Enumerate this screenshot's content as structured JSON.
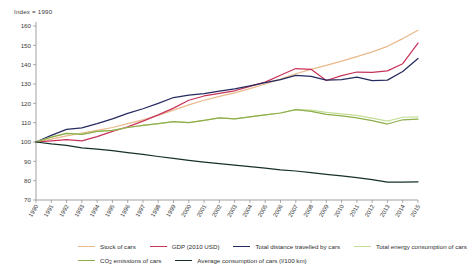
{
  "index_note": "Index = 1990",
  "legend": {
    "items": [
      {
        "label": "Stock of cars",
        "color": "#e8b98a",
        "width": 1.3
      },
      {
        "label": "GDP (2010 USD)",
        "color": "#c9335a",
        "width": 1.6
      },
      {
        "label": "Total distance travelled by cars",
        "color": "#262a5e",
        "width": 1.9
      },
      {
        "label": "Total energy consumption of cars",
        "color": "#c3de96",
        "width": 1.3
      },
      {
        "label": "CO2 emissions of cars",
        "color": "#8fae4b",
        "width": 1.3
      },
      {
        "label": "Average consumption of cars (l/100 km)",
        "color": "#16302a",
        "width": 1.9
      }
    ],
    "co2_prefix": "CO",
    "co2_sub": "2",
    "co2_suffix": " emissions of cars"
  },
  "chart_data": {
    "type": "line",
    "title": "",
    "subtitle": "",
    "xlabel": "",
    "ylabel": "",
    "ylim": [
      70,
      160
    ],
    "yticks": [
      70,
      80,
      90,
      100,
      110,
      120,
      130,
      140,
      150,
      160
    ],
    "grid": false,
    "legend_position": "bottom",
    "x": [
      1990,
      1991,
      1992,
      1993,
      1994,
      1995,
      1996,
      1997,
      1998,
      1999,
      2000,
      2001,
      2002,
      2003,
      2004,
      2005,
      2006,
      2007,
      2008,
      2009,
      2010,
      2011,
      2012,
      2013,
      2014,
      2015
    ],
    "categories": [
      "1990",
      "1991",
      "1992",
      "1993",
      "1994",
      "1995",
      "1996",
      "1997",
      "1998",
      "1999",
      "2000",
      "2001",
      "2002",
      "2003",
      "2004",
      "2005",
      "2006",
      "2007",
      "2008",
      "2009",
      "2010",
      "2011",
      "2012",
      "2013",
      "2014",
      "2015"
    ],
    "series": [
      {
        "name": "Stock of cars",
        "color": "#e8b98a",
        "values": [
          100,
          101.5,
          103.2,
          104.6,
          106.0,
          107.5,
          109.5,
          111.5,
          113.8,
          116.5,
          119.2,
          121.6,
          123.6,
          125.4,
          127.6,
          130.0,
          132.5,
          135.3,
          137.6,
          139.6,
          141.8,
          144.2,
          146.6,
          149.5,
          153.5,
          157.8
        ]
      },
      {
        "name": "GDP (2010 USD)",
        "color": "#c9335a",
        "values": [
          100,
          100.6,
          101.2,
          100.6,
          102.8,
          105.5,
          107.8,
          110.8,
          114.0,
          117.5,
          121.6,
          123.8,
          125.2,
          126.5,
          128.8,
          131.0,
          134.5,
          138.0,
          137.6,
          131.8,
          134.3,
          136.2,
          136.0,
          136.8,
          140.5,
          151.2
        ]
      },
      {
        "name": "Total distance travelled by cars",
        "color": "#262a5e",
        "values": [
          100,
          103.4,
          106.5,
          107.3,
          109.5,
          112.0,
          114.8,
          117.2,
          120.0,
          123.0,
          124.2,
          125.0,
          126.3,
          127.5,
          129.0,
          130.7,
          132.3,
          134.5,
          134.0,
          132.0,
          132.3,
          133.6,
          131.8,
          132.0,
          136.5,
          143.2
        ]
      },
      {
        "name": "Total energy consumption of cars",
        "color": "#c3de96",
        "values": [
          100,
          102.5,
          104.5,
          104.0,
          105.5,
          106.0,
          107.5,
          108.6,
          109.5,
          110.5,
          110.0,
          111.2,
          112.5,
          112.0,
          113.0,
          114.0,
          115.0,
          116.8,
          116.5,
          115.3,
          114.6,
          113.8,
          112.3,
          110.8,
          112.8,
          113.0
        ]
      },
      {
        "name": "CO2 emissions of cars",
        "color": "#8fae4b",
        "values": [
          100,
          102.5,
          104.5,
          104.0,
          105.5,
          106.0,
          107.5,
          108.6,
          109.5,
          110.5,
          110.0,
          111.2,
          112.5,
          112.0,
          113.0,
          114.0,
          115.0,
          116.8,
          115.8,
          114.3,
          113.5,
          112.5,
          111.0,
          109.3,
          111.5,
          111.8
        ]
      },
      {
        "name": "Average consumption of cars (l/100 km)",
        "color": "#16302a",
        "values": [
          100,
          99.0,
          98.2,
          97.0,
          96.3,
          95.5,
          94.5,
          93.6,
          92.5,
          91.5,
          90.5,
          89.6,
          88.8,
          88.0,
          87.3,
          86.5,
          85.6,
          85.0,
          84.2,
          83.3,
          82.5,
          81.6,
          80.5,
          79.2,
          79.3,
          79.4
        ]
      }
    ]
  }
}
